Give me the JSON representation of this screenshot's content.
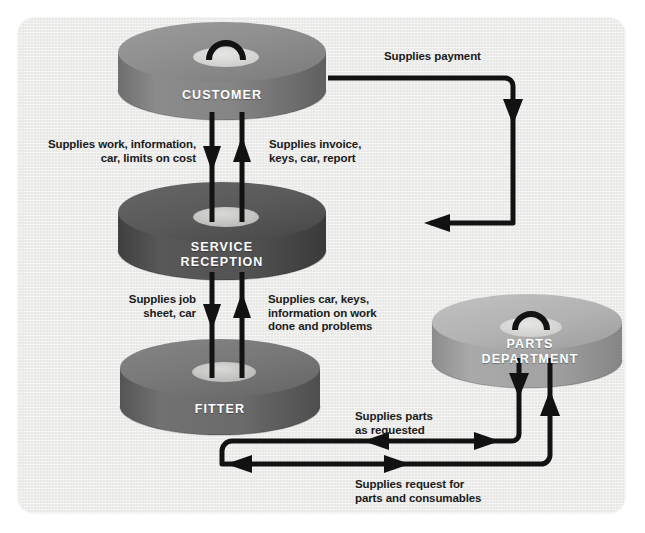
{
  "diagram": {
    "background_color": "#e8e8e6",
    "line_color": "#121212",
    "nodes": [
      {
        "id": "customer",
        "label": "CUSTOMER",
        "top_color": "#8f8f8f",
        "side_color": "#7a7a7a",
        "shape": "cylinder"
      },
      {
        "id": "service-reception",
        "label": "SERVICE\nRECEPTION",
        "top_color": "#5e5e5e",
        "side_color": "#4d4d4d",
        "shape": "cylinder"
      },
      {
        "id": "fitter",
        "label": "FITTER",
        "top_color": "#777777",
        "side_color": "#636363",
        "shape": "cylinder"
      },
      {
        "id": "parts-department",
        "label": "PARTS\nDEPARTMENT",
        "top_color": "#b3b3b3",
        "side_color": "#9a9a9a",
        "shape": "cylinder"
      }
    ],
    "flows": [
      {
        "id": "customer-to-reception",
        "text": "Supplies work, information,\ncar, limits on cost",
        "from": "customer",
        "to": "service-reception",
        "direction": "down"
      },
      {
        "id": "reception-to-customer",
        "text": "Supplies invoice,\nkeys, car, report",
        "from": "service-reception",
        "to": "customer",
        "direction": "up"
      },
      {
        "id": "supplies-payment",
        "text": "Supplies payment",
        "from": "customer",
        "to": "service-reception",
        "direction": "right-down-left"
      },
      {
        "id": "reception-to-fitter",
        "text": "Supplies job\nsheet, car",
        "from": "service-reception",
        "to": "fitter",
        "direction": "down"
      },
      {
        "id": "fitter-to-reception",
        "text": "Supplies car, keys,\ninformation on work\ndone and problems",
        "from": "fitter",
        "to": "service-reception",
        "direction": "up"
      },
      {
        "id": "supplies-parts",
        "text": "Supplies parts\nas requested",
        "from": "parts-department",
        "to": "fitter",
        "direction": "left"
      },
      {
        "id": "supplies-request",
        "text": "Supplies request for\nparts and consumables",
        "from": "fitter",
        "to": "parts-department",
        "direction": "right"
      }
    ]
  }
}
